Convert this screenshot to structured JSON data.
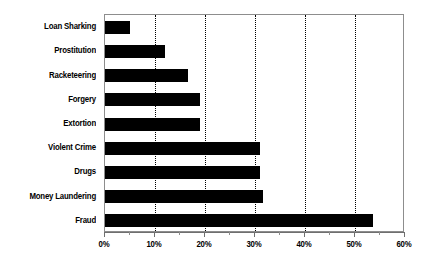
{
  "chart_data": {
    "type": "bar",
    "orientation": "horizontal",
    "title": "",
    "xlabel": "",
    "ylabel": "",
    "categories": [
      "Loan Sharking",
      "Prostitution",
      "Racketeering",
      "Forgery",
      "Extortion",
      "Violent Crime",
      "Drugs",
      "Money Laundering",
      "Fraud"
    ],
    "values": [
      5,
      12,
      16.5,
      19,
      19,
      31,
      31,
      31.5,
      53.5
    ],
    "xlim": [
      0,
      60
    ],
    "xticks": [
      0,
      10,
      20,
      30,
      40,
      50,
      60
    ],
    "xtick_labels": [
      "0%",
      "10%",
      "20%",
      "30%",
      "40%",
      "50%",
      "60%"
    ],
    "x_minor_ticks": [
      5,
      15,
      25,
      35,
      45,
      55
    ],
    "gridlines": [
      10,
      20,
      30,
      40,
      50
    ],
    "grid": true,
    "grid_style": "dotted",
    "legend": null,
    "bar_color": "#000000",
    "plot_border_color": "#8d8d8d",
    "background_color": "#ffffff"
  }
}
